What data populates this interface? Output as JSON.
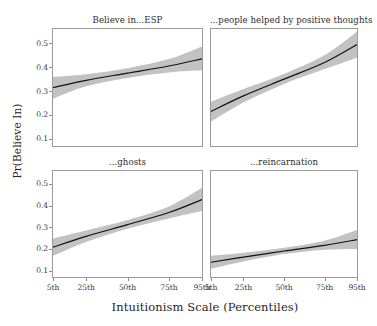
{
  "figure": {
    "ylabel": "Pr(Believe In)",
    "xlabel": "Intuitionism Scale (Percentiles)"
  },
  "axes": {
    "ytick_labels": [
      "0.5",
      "0.4",
      "0.3",
      "0.2",
      "0.1"
    ],
    "xtick_labels": [
      "5th",
      "25th",
      "50th",
      "75th",
      "95th"
    ]
  },
  "panels": [
    {
      "title": "Believe in...ESP"
    },
    {
      "title": "...people helped by positive thoughts"
    },
    {
      "title": "...ghosts"
    },
    {
      "title": "...reincarnation"
    }
  ],
  "chart_data": {
    "type": "line",
    "title": "",
    "xlabel": "Intuitionism Scale (Percentiles)",
    "ylabel": "Pr(Believe In)",
    "xlim": [
      5,
      95
    ],
    "ylim": [
      0.07,
      0.56
    ],
    "grid": false,
    "legend": "none",
    "layout": {
      "rows": 2,
      "cols": 2,
      "shared_x": true,
      "shared_y": true
    },
    "x": [
      5,
      25,
      50,
      75,
      95
    ],
    "xtick_labels": [
      "5th",
      "25th",
      "50th",
      "75th",
      "95th"
    ],
    "ytick_values": [
      0.1,
      0.2,
      0.3,
      0.4,
      0.5
    ],
    "ytick_labels": [
      "0.1",
      "0.2",
      "0.3",
      "0.4",
      "0.5"
    ],
    "band_color": "#c2c2c2",
    "line_color": "#111111",
    "panels": [
      {
        "title": "Believe in...ESP",
        "series": [
          {
            "name": "fitted",
            "values": [
              0.315,
              0.345,
              0.375,
              0.405,
              0.435
            ]
          },
          {
            "name": "ci_lower",
            "values": [
              0.268,
              0.32,
              0.355,
              0.378,
              0.387
            ]
          },
          {
            "name": "ci_upper",
            "values": [
              0.36,
              0.371,
              0.396,
              0.434,
              0.487
            ]
          }
        ]
      },
      {
        "title": "...people helped by positive thoughts",
        "series": [
          {
            "name": "fitted",
            "values": [
              0.215,
              0.28,
              0.35,
              0.42,
              0.495
            ]
          },
          {
            "name": "ci_lower",
            "values": [
              0.172,
              0.252,
              0.33,
              0.392,
              0.44
            ]
          },
          {
            "name": "ci_upper",
            "values": [
              0.256,
              0.309,
              0.372,
              0.45,
              0.548
            ]
          }
        ]
      },
      {
        "title": "...ghosts",
        "series": [
          {
            "name": "fitted",
            "values": [
              0.208,
              0.258,
              0.312,
              0.368,
              0.428
            ]
          },
          {
            "name": "ci_lower",
            "values": [
              0.168,
              0.232,
              0.293,
              0.341,
              0.375
            ]
          },
          {
            "name": "ci_upper",
            "values": [
              0.248,
              0.285,
              0.333,
              0.396,
              0.482
            ]
          }
        ]
      },
      {
        "title": "...reincarnation",
        "series": [
          {
            "name": "fitted",
            "values": [
              0.138,
              0.162,
              0.19,
              0.216,
              0.243
            ]
          },
          {
            "name": "ci_lower",
            "values": [
              0.108,
              0.142,
              0.176,
              0.196,
              0.2
            ]
          },
          {
            "name": "ci_upper",
            "values": [
              0.168,
              0.182,
              0.205,
              0.238,
              0.287
            ]
          }
        ]
      }
    ]
  }
}
